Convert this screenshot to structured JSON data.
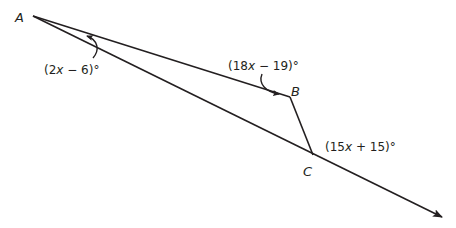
{
  "figure": {
    "type": "geometry-triangle-exterior-angle",
    "stroke_color": "#231f20",
    "background": "#ffffff",
    "points": {
      "A": {
        "label": "A",
        "x": 33,
        "y": 16
      },
      "B": {
        "label": "B",
        "x": 290,
        "y": 97
      },
      "C": {
        "label": "C",
        "x": 313,
        "y": 155
      },
      "ray_end": {
        "x": 442,
        "y": 217
      }
    },
    "angles": {
      "A": {
        "expression": "(2x − 6)°",
        "prefix": "(2",
        "var": "x",
        "suffix": " − 6)°"
      },
      "B": {
        "expression": "(18x − 19)°",
        "prefix": "(18",
        "var": "x",
        "suffix": " − 19)°"
      },
      "C_exterior": {
        "expression": "(15x + 15)°",
        "prefix": "(15",
        "var": "x",
        "suffix": " + 15)°"
      }
    },
    "segments": [
      "AB",
      "BC",
      "AC extended as ray beyond C"
    ]
  }
}
